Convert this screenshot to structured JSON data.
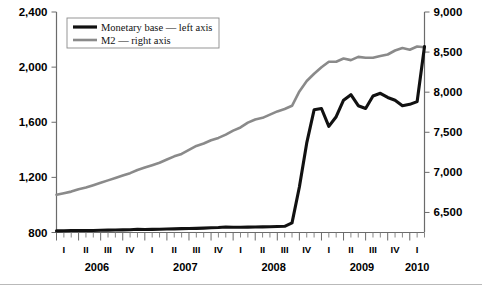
{
  "chart_data": {
    "type": "line",
    "title": "",
    "subtitle": "",
    "xlabel": "",
    "grid": false,
    "legend_position": "top-left",
    "axes": {
      "left": {
        "label": "Monetary base",
        "ylim": [
          800,
          2400
        ],
        "ticks": [
          800,
          1200,
          1600,
          2000,
          2400
        ],
        "tick_labels": [
          "800",
          "1,200",
          "1,600",
          "2,000",
          "2,400"
        ]
      },
      "right": {
        "label": "M2",
        "ylim": [
          6250,
          9000
        ],
        "ticks": [
          6500,
          7000,
          7500,
          8000,
          8500,
          9000
        ],
        "tick_labels": [
          "6,500",
          "7,000",
          "7,500",
          "8,000",
          "8,500",
          "9,000"
        ]
      }
    },
    "x_axis": {
      "quarter_labels": [
        "I",
        "II",
        "III",
        "IV",
        "I",
        "II",
        "III",
        "IV",
        "I",
        "II",
        "III",
        "IV",
        "I",
        "II",
        "III",
        "IV",
        "I"
      ],
      "year_labels": [
        "2006",
        "2007",
        "2008",
        "2009",
        "2010"
      ],
      "ticks_per_quarter": 3,
      "minor_tick_unit": "month"
    },
    "legend": [
      {
        "name": "Monetary base — left axis",
        "color": "#111111",
        "axis": "left",
        "width": 3.2
      },
      {
        "name": "M2 — right axis",
        "color": "#8a8a8a",
        "axis": "right",
        "width": 2.6
      }
    ],
    "series": [
      {
        "name": "Monetary base — left axis",
        "axis": "left",
        "color": "#111111",
        "x": [
          "2006-01",
          "2006-02",
          "2006-03",
          "2006-04",
          "2006-05",
          "2006-06",
          "2006-07",
          "2006-08",
          "2006-09",
          "2006-10",
          "2006-11",
          "2006-12",
          "2007-01",
          "2007-02",
          "2007-03",
          "2007-04",
          "2007-05",
          "2007-06",
          "2007-07",
          "2007-08",
          "2007-09",
          "2007-10",
          "2007-11",
          "2007-12",
          "2008-01",
          "2008-02",
          "2008-03",
          "2008-04",
          "2008-05",
          "2008-06",
          "2008-07",
          "2008-08",
          "2008-09",
          "2008-10",
          "2008-11",
          "2008-12",
          "2009-01",
          "2009-02",
          "2009-03",
          "2009-04",
          "2009-05",
          "2009-06",
          "2009-07",
          "2009-08",
          "2009-09",
          "2009-10",
          "2009-11",
          "2009-12",
          "2010-01",
          "2010-02",
          "2010-03"
        ],
        "values": [
          812,
          813,
          814,
          814,
          815,
          815,
          816,
          817,
          818,
          819,
          820,
          824,
          822,
          823,
          824,
          825,
          826,
          828,
          829,
          830,
          832,
          834,
          836,
          840,
          838,
          838,
          839,
          840,
          841,
          842,
          843,
          845,
          870,
          1130,
          1450,
          1690,
          1700,
          1570,
          1640,
          1760,
          1800,
          1720,
          1700,
          1790,
          1810,
          1780,
          1760,
          1720,
          1730,
          1750,
          2150
        ],
        "annotations": []
      },
      {
        "name": "M2 — right axis",
        "axis": "right",
        "color": "#8a8a8a",
        "x": [
          "2006-01",
          "2006-02",
          "2006-03",
          "2006-04",
          "2006-05",
          "2006-06",
          "2006-07",
          "2006-08",
          "2006-09",
          "2006-10",
          "2006-11",
          "2006-12",
          "2007-01",
          "2007-02",
          "2007-03",
          "2007-04",
          "2007-05",
          "2007-06",
          "2007-07",
          "2007-08",
          "2007-09",
          "2007-10",
          "2007-11",
          "2007-12",
          "2008-01",
          "2008-02",
          "2008-03",
          "2008-04",
          "2008-05",
          "2008-06",
          "2008-07",
          "2008-08",
          "2008-09",
          "2008-10",
          "2008-11",
          "2008-12",
          "2009-01",
          "2009-02",
          "2009-03",
          "2009-04",
          "2009-05",
          "2009-06",
          "2009-07",
          "2009-08",
          "2009-09",
          "2009-10",
          "2009-11",
          "2009-12",
          "2010-01",
          "2010-02",
          "2010-03"
        ],
        "values": [
          6720,
          6740,
          6760,
          6790,
          6810,
          6840,
          6870,
          6900,
          6930,
          6960,
          6990,
          7030,
          7060,
          7090,
          7120,
          7160,
          7200,
          7230,
          7280,
          7330,
          7360,
          7400,
          7430,
          7470,
          7520,
          7560,
          7620,
          7660,
          7680,
          7720,
          7760,
          7790,
          7830,
          8010,
          8140,
          8230,
          8310,
          8380,
          8380,
          8420,
          8400,
          8440,
          8430,
          8430,
          8450,
          8470,
          8520,
          8550,
          8530,
          8570,
          8560
        ],
        "annotations": []
      }
    ]
  }
}
